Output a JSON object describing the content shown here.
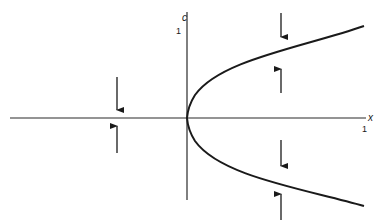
{
  "diagram": {
    "type": "bifurcation-diagram",
    "axes": {
      "horizontal": {
        "label": "x",
        "tick_label": "1"
      },
      "vertical": {
        "label": "c",
        "tick_label": "1"
      }
    },
    "curve": {
      "shape": "parabola",
      "equation": "c = x^2 (opening rightward)",
      "color": "#1a1a1a"
    },
    "arrows": [
      {
        "id": "left-upper",
        "direction": "down"
      },
      {
        "id": "left-lower",
        "direction": "up"
      },
      {
        "id": "right-top-above",
        "direction": "down"
      },
      {
        "id": "right-top-below",
        "direction": "up"
      },
      {
        "id": "right-bottom-above",
        "direction": "down"
      },
      {
        "id": "right-bottom-below",
        "direction": "up"
      }
    ],
    "colors": {
      "ink": "#1a1a1a",
      "axis": "#2a2a2a",
      "background": "#ffffff"
    }
  }
}
